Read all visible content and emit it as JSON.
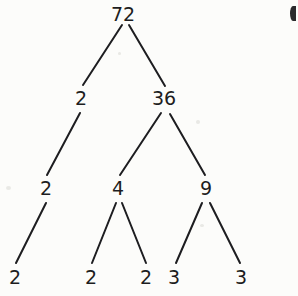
{
  "diagram": {
    "type": "factor-tree",
    "background_color": "#fcfcfa",
    "ink_color": "#1d1d20",
    "width": 298,
    "height": 296,
    "nodes": [
      {
        "id": "n72",
        "label": "72",
        "x": 123,
        "y": 14,
        "level": 0
      },
      {
        "id": "n2a",
        "label": "2",
        "x": 81,
        "y": 98,
        "level": 1
      },
      {
        "id": "n36",
        "label": "36",
        "x": 164,
        "y": 98,
        "level": 1
      },
      {
        "id": "n2b",
        "label": "2",
        "x": 46,
        "y": 188,
        "level": 2
      },
      {
        "id": "n4",
        "label": "4",
        "x": 118,
        "y": 188,
        "level": 2
      },
      {
        "id": "n9",
        "label": "9",
        "x": 206,
        "y": 188,
        "level": 2
      },
      {
        "id": "n2c",
        "label": "2",
        "x": 15,
        "y": 277,
        "level": 3
      },
      {
        "id": "n2d",
        "label": "2",
        "x": 91,
        "y": 277,
        "level": 3
      },
      {
        "id": "n2e",
        "label": "2",
        "x": 146,
        "y": 277,
        "level": 3
      },
      {
        "id": "n3a",
        "label": "3",
        "x": 174,
        "y": 277,
        "level": 3
      },
      {
        "id": "n3b",
        "label": "3",
        "x": 241,
        "y": 277,
        "level": 3
      }
    ],
    "edges": [
      {
        "from": "n72",
        "to": "n2a",
        "x1": 122,
        "y1": 25,
        "x2": 83,
        "y2": 85
      },
      {
        "from": "n72",
        "to": "n36",
        "x1": 129,
        "y1": 25,
        "x2": 165,
        "y2": 86
      },
      {
        "from": "n2a",
        "to": "n2b",
        "x1": 80,
        "y1": 113,
        "x2": 47,
        "y2": 175
      },
      {
        "from": "n36",
        "to": "n4",
        "x1": 161,
        "y1": 113,
        "x2": 120,
        "y2": 175
      },
      {
        "from": "n36",
        "to": "n9",
        "x1": 170,
        "y1": 114,
        "x2": 205,
        "y2": 175
      },
      {
        "from": "n2b",
        "to": "n2c",
        "x1": 46,
        "y1": 203,
        "x2": 16,
        "y2": 263
      },
      {
        "from": "n4",
        "to": "n2d",
        "x1": 116,
        "y1": 203,
        "x2": 92,
        "y2": 263
      },
      {
        "from": "n4",
        "to": "n2e",
        "x1": 122,
        "y1": 203,
        "x2": 146,
        "y2": 263
      },
      {
        "from": "n9",
        "to": "n3a",
        "x1": 202,
        "y1": 203,
        "x2": 176,
        "y2": 263
      },
      {
        "from": "n9",
        "to": "n3b",
        "x1": 210,
        "y1": 203,
        "x2": 240,
        "y2": 263
      }
    ],
    "margin_artifact": {
      "name": "page-edge-mark",
      "description": "clipped dark mark at top-right margin"
    }
  }
}
